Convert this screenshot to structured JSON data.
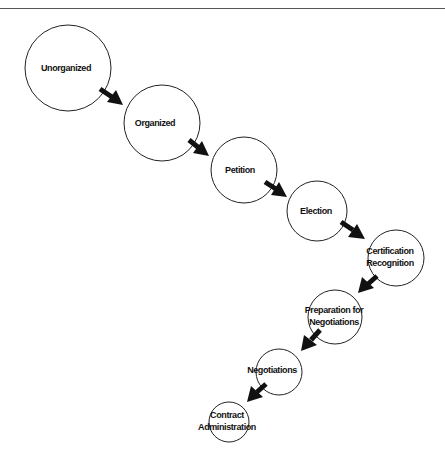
{
  "diagram": {
    "type": "process-flow",
    "direction": "top-left to bottom, descending chain of circles",
    "colors": {
      "stroke": "#222222",
      "text": "#111111",
      "arrow": "#111111",
      "background": "#ffffff"
    },
    "nodes": [
      {
        "id": "unorganized",
        "lines": [
          "Unorganized"
        ],
        "cx": 68,
        "cy": 68,
        "r": 43
      },
      {
        "id": "organized",
        "lines": [
          "Organized"
        ],
        "cx": 162,
        "cy": 123,
        "r": 38
      },
      {
        "id": "petition",
        "lines": [
          "Petition"
        ],
        "cx": 244,
        "cy": 170,
        "r": 33
      },
      {
        "id": "election",
        "lines": [
          "Election"
        ],
        "cx": 317,
        "cy": 211,
        "r": 30
      },
      {
        "id": "certification-recognition",
        "lines": [
          "Certification",
          "Recognition"
        ],
        "cx": 396,
        "cy": 258,
        "r": 28
      },
      {
        "id": "preparation-for-negotiations",
        "lines": [
          "Preparation for",
          "Negotiations"
        ],
        "cx": 335,
        "cy": 317,
        "r": 27
      },
      {
        "id": "negotiations",
        "lines": [
          "Negotiations"
        ],
        "cx": 279,
        "cy": 372,
        "r": 23
      },
      {
        "id": "contract-administration",
        "lines": [
          "Contract",
          "Administration"
        ],
        "cx": 229,
        "cy": 422,
        "r": 20
      }
    ],
    "edges": [
      {
        "from": "unorganized",
        "to": "organized"
      },
      {
        "from": "organized",
        "to": "petition"
      },
      {
        "from": "petition",
        "to": "election"
      },
      {
        "from": "election",
        "to": "certification-recognition"
      },
      {
        "from": "certification-recognition",
        "to": "preparation-for-negotiations"
      },
      {
        "from": "preparation-for-negotiations",
        "to": "negotiations"
      },
      {
        "from": "negotiations",
        "to": "contract-administration"
      }
    ]
  },
  "labels": {
    "n0": "Unorganized",
    "n1": "Organized",
    "n2": "Petition",
    "n3": "Election",
    "n4a": "Certification",
    "n4b": "Recognition",
    "n5a": "Preparation for",
    "n5b": "Negotiations",
    "n6": "Negotiations",
    "n7a": "Contract",
    "n7b": "Administration"
  }
}
